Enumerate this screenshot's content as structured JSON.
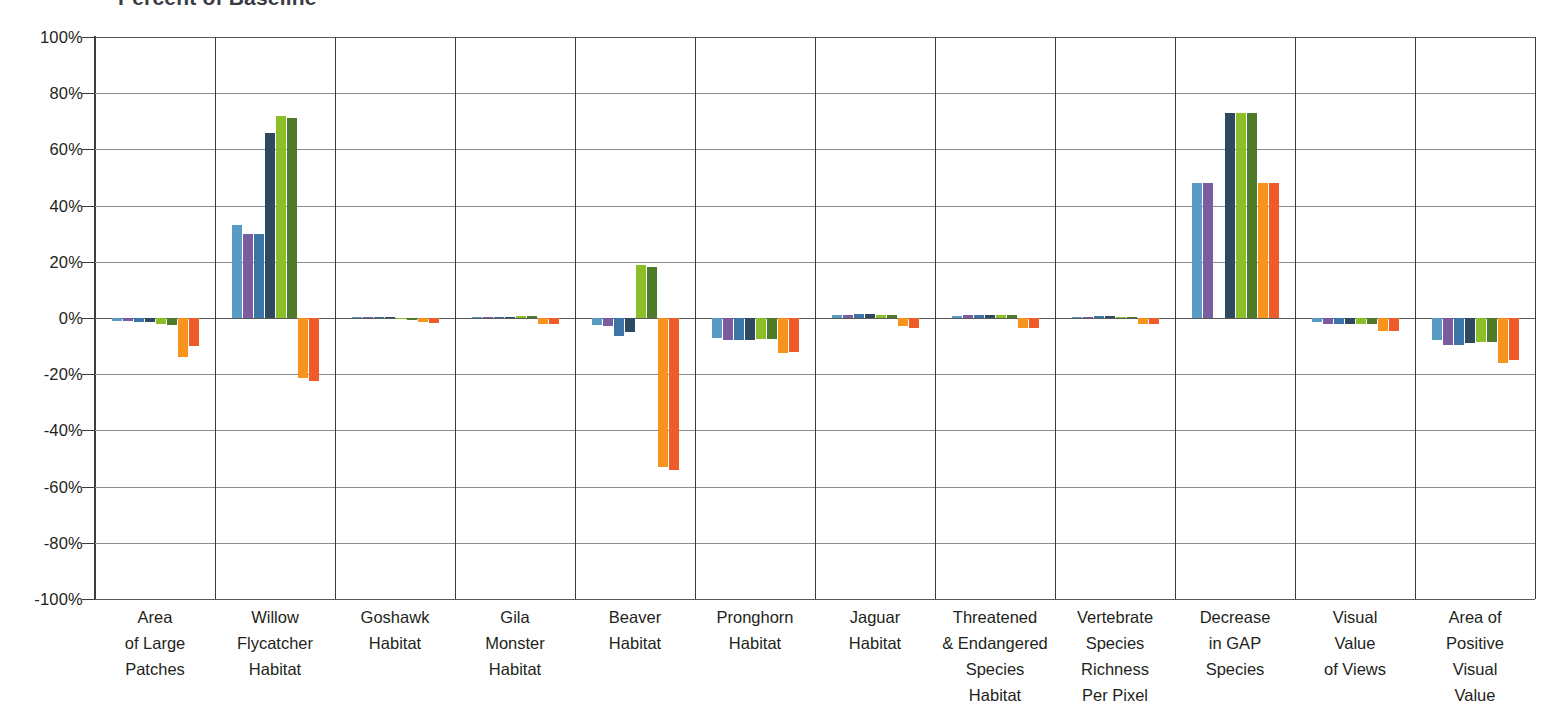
{
  "title": "Percent of Baseline",
  "chart_data": {
    "type": "bar",
    "title": "Percent of Baseline",
    "xlabel": "",
    "ylabel": "",
    "ylim": [
      -100,
      100
    ],
    "ytick_labels": [
      "100%",
      "80%",
      "60%",
      "40%",
      "20%",
      "0%",
      "-20%",
      "-40%",
      "-60%",
      "-80%",
      "-100%"
    ],
    "ytick_values": [
      100,
      80,
      60,
      40,
      20,
      0,
      -20,
      -40,
      -60,
      -80,
      -100
    ],
    "grid": true,
    "legend": "none",
    "value_unit": "percent",
    "categories": [
      "Area of Large Patches",
      "Willow Flycatcher Habitat",
      "Goshawk Habitat",
      "Gila Monster Habitat",
      "Beaver Habitat",
      "Pronghorn Habitat",
      "Jaguar Habitat",
      "Threatened & Endangered Species Habitat",
      "Vertebrate Species Richness Per Pixel",
      "Decrease in GAP Species",
      "Visual Value of Views",
      "Area of Positive Visual Value"
    ],
    "category_label_lines": [
      [
        "Area",
        "of Large",
        "Patches"
      ],
      [
        "Willow",
        "Flycatcher",
        "Habitat"
      ],
      [
        "Goshawk",
        "Habitat"
      ],
      [
        "Gila",
        "Monster",
        "Habitat"
      ],
      [
        "Beaver",
        "Habitat"
      ],
      [
        "Pronghorn",
        "Habitat"
      ],
      [
        "Jaguar",
        "Habitat"
      ],
      [
        "Threatened",
        "& Endangered",
        "Species",
        "Habitat"
      ],
      [
        "Vertebrate",
        "Species",
        "Richness",
        "Per Pixel"
      ],
      [
        "Decrease",
        "in GAP",
        "Species"
      ],
      [
        "Visual",
        "Value",
        "of Views"
      ],
      [
        "Area of",
        "Positive",
        "Visual",
        "Value"
      ]
    ],
    "series": [
      {
        "name": "Series 1",
        "color": "#5a9bc4",
        "values": [
          -1.0,
          33.0,
          0.3,
          0.4,
          -2.5,
          -7.0,
          1.0,
          0.7,
          0.5,
          48.0,
          -1.5,
          -8.0
        ]
      },
      {
        "name": "Series 2",
        "color": "#7a5ca0",
        "values": [
          -1.2,
          30.0,
          0.3,
          0.4,
          -3.0,
          -8.0,
          1.2,
          0.9,
          0.5,
          48.0,
          -2.0,
          -9.5
        ]
      },
      {
        "name": "Series 3",
        "color": "#3d74a8",
        "values": [
          -1.5,
          30.0,
          0.3,
          0.4,
          -6.5,
          -8.0,
          1.4,
          1.0,
          0.6,
          0.0,
          -2.2,
          -9.5
        ]
      },
      {
        "name": "Series 4",
        "color": "#2d4a61",
        "values": [
          -1.5,
          66.0,
          0.4,
          0.5,
          -5.0,
          -8.0,
          1.4,
          1.0,
          0.6,
          73.0,
          -2.2,
          -9.0
        ]
      },
      {
        "name": "Series 5",
        "color": "#8cbe2a",
        "values": [
          -2.0,
          72.0,
          -0.5,
          0.8,
          19.0,
          -7.5,
          1.2,
          1.2,
          0.5,
          73.0,
          -2.0,
          -8.5
        ]
      },
      {
        "name": "Series 6",
        "color": "#4f7a2a",
        "values": [
          -2.5,
          71.0,
          -0.7,
          0.8,
          18.0,
          -7.5,
          1.2,
          1.2,
          0.5,
          73.0,
          -2.0,
          -8.5
        ]
      },
      {
        "name": "Series 7",
        "color": "#f7941e",
        "values": [
          -14.0,
          -21.5,
          -1.5,
          -2.0,
          -53.0,
          -12.5,
          -3.0,
          -3.5,
          -2.0,
          48.0,
          -4.5,
          -16.0
        ]
      },
      {
        "name": "Series 8",
        "color": "#f15a29",
        "values": [
          -10.0,
          -22.5,
          -1.8,
          -2.0,
          -54.0,
          -12.0,
          -3.5,
          -3.5,
          -2.0,
          48.0,
          -4.5,
          -15.0
        ]
      }
    ]
  },
  "axis": {
    "x_separator_count": 12,
    "y_axis_color": "#3c3c3c",
    "gridline_color": "#8b8b8b"
  }
}
